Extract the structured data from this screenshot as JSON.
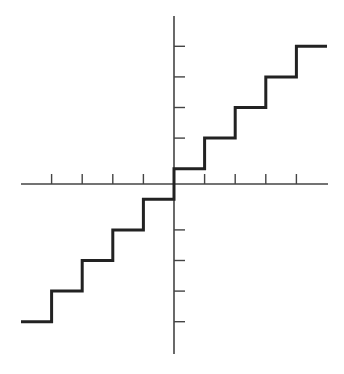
{
  "chart_data": {
    "type": "line",
    "title": "",
    "xlabel": "",
    "ylabel": "",
    "grid": false,
    "legend": null,
    "x_ticks": [
      -4,
      -3,
      -2,
      -1,
      1,
      2,
      3,
      4
    ],
    "y_ticks": [
      -4.5,
      -3.5,
      -2.5,
      -1.5,
      1.5,
      2.5,
      3.5,
      4.5
    ],
    "xlim": [
      -5,
      5
    ],
    "ylim": [
      -5.5,
      5.5
    ],
    "series": [
      {
        "name": "step function",
        "color": "#222222",
        "segments": [
          {
            "x": [
              -5,
              -4
            ],
            "y": -4.5
          },
          {
            "x": [
              -4,
              -3
            ],
            "y": -3.5
          },
          {
            "x": [
              -3,
              -2
            ],
            "y": -2.5
          },
          {
            "x": [
              -2,
              -1
            ],
            "y": -1.5
          },
          {
            "x": [
              -1,
              0
            ],
            "y": -0.5
          },
          {
            "x": [
              0,
              1
            ],
            "y": 0.5
          },
          {
            "x": [
              1,
              2
            ],
            "y": 1.5
          },
          {
            "x": [
              2,
              3
            ],
            "y": 2.5
          },
          {
            "x": [
              3,
              4
            ],
            "y": 3.5
          },
          {
            "x": [
              4,
              5
            ],
            "y": 4.5
          }
        ]
      }
    ],
    "colors": {
      "axis": "#444444",
      "line": "#222222",
      "background": "#ffffff"
    }
  }
}
